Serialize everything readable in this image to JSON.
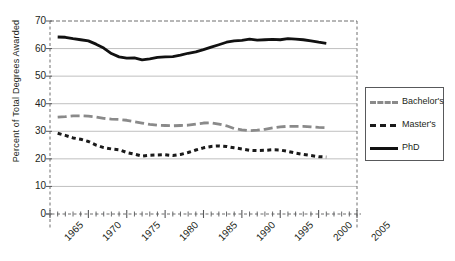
{
  "chart_data": {
    "type": "line",
    "title": "",
    "xlabel": "",
    "ylabel": "Percent of Total Degrees Awarded",
    "xlim": [
      1965,
      2005
    ],
    "ylim": [
      0,
      70
    ],
    "ytick_step": 10,
    "xtick_step": 5,
    "minor_xtick_step": 1,
    "grid": "horizontal",
    "legend_position": "right-outside",
    "x": [
      1966,
      1967,
      1968,
      1969,
      1970,
      1971,
      1972,
      1973,
      1974,
      1975,
      1976,
      1977,
      1978,
      1979,
      1980,
      1981,
      1982,
      1983,
      1984,
      1985,
      1986,
      1987,
      1988,
      1989,
      1990,
      1991,
      1992,
      1993,
      1994,
      1995,
      1996,
      1997,
      1998,
      1999,
      2000,
      2001
    ],
    "yticks": [
      0,
      10,
      20,
      30,
      40,
      50,
      60,
      70
    ],
    "xticks": [
      1965,
      1970,
      1975,
      1980,
      1985,
      1990,
      1995,
      2000,
      2005
    ],
    "series": [
      {
        "name": "Bachelor's",
        "style": "dashed",
        "color": "#8a8a8a",
        "values": [
          35.1,
          35.3,
          35.6,
          35.6,
          35.5,
          35.2,
          34.7,
          34.4,
          34.3,
          34.0,
          33.5,
          33.0,
          32.5,
          32.2,
          32.1,
          32.0,
          32.1,
          32.2,
          32.6,
          33.0,
          33.1,
          32.6,
          32.0,
          31.0,
          30.5,
          30.2,
          30.4,
          30.7,
          31.2,
          31.6,
          31.8,
          31.8,
          31.8,
          31.6,
          31.4,
          31.3
        ]
      },
      {
        "name": "Master's",
        "style": "dotted",
        "color": "#1a1a1a",
        "values": [
          29.3,
          28.5,
          27.6,
          27.1,
          26.3,
          25.0,
          24.1,
          23.6,
          23.3,
          22.3,
          21.7,
          21.0,
          21.3,
          21.4,
          21.5,
          21.2,
          21.6,
          22.3,
          23.2,
          24.0,
          24.5,
          24.7,
          24.5,
          24.0,
          23.6,
          23.1,
          23.0,
          23.1,
          23.3,
          23.2,
          22.7,
          22.1,
          21.6,
          21.2,
          20.8,
          20.7
        ]
      },
      {
        "name": "PhD",
        "style": "solid",
        "color": "#111111",
        "values": [
          64.2,
          64.1,
          63.6,
          63.2,
          62.8,
          61.6,
          60.2,
          58.2,
          57.0,
          56.5,
          56.6,
          55.9,
          56.3,
          56.8,
          57.0,
          57.1,
          57.6,
          58.3,
          58.8,
          59.6,
          60.5,
          61.4,
          62.3,
          62.8,
          63.0,
          63.4,
          63.1,
          63.2,
          63.3,
          63.2,
          63.6,
          63.4,
          63.2,
          62.8,
          62.3,
          61.9
        ]
      }
    ]
  },
  "legend": {
    "items": [
      {
        "label": "Bachelor's"
      },
      {
        "label": "Master's"
      },
      {
        "label": "PhD"
      }
    ]
  }
}
